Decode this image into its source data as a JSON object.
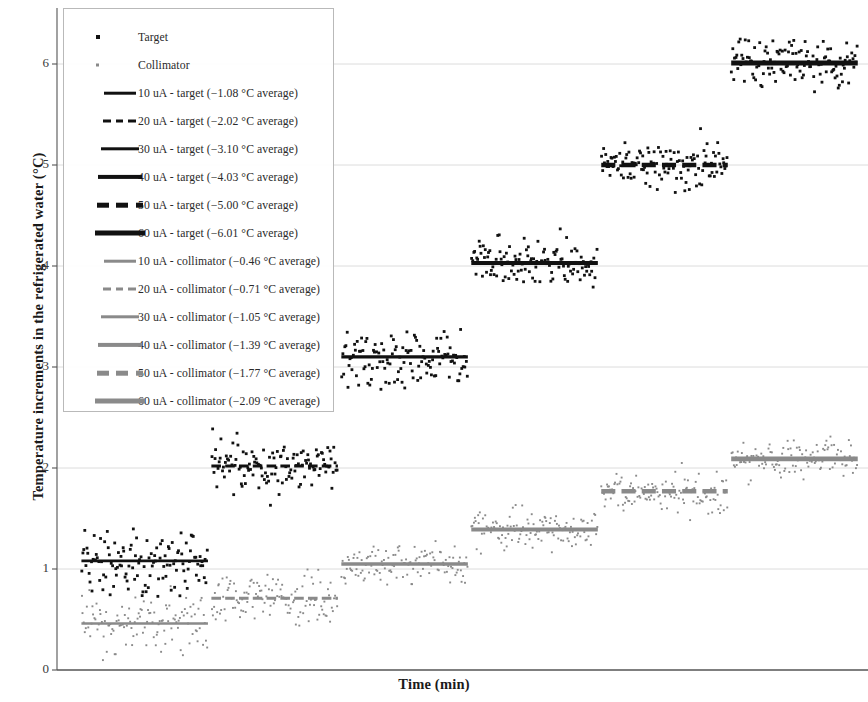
{
  "chart_data": {
    "type": "scatter",
    "title": "",
    "xlabel": "Time (min)",
    "ylabel": "Temperature increments in the refrigerated water (°C)",
    "ylim": [
      0,
      6.4
    ],
    "yticks": [
      0,
      1,
      2,
      3,
      4,
      5,
      6
    ],
    "ytick_labels": [
      "0",
      "1",
      "2",
      "3",
      "4",
      "5",
      "6"
    ],
    "xticks": [],
    "xtick_labels": [],
    "grid": "horizontal",
    "legend_position": "upper-left-inside",
    "colors": {
      "target": "#111111",
      "collimator": "#8a8a8a",
      "gridline": "#dcdcdc",
      "axis": "#555555"
    },
    "series": [
      {
        "name": "Target",
        "marker": "square",
        "color": "#111111",
        "steps": [
          {
            "current": "10 uA",
            "average": 1.08,
            "x_start": 0.5,
            "x_end": 19.0,
            "scatter_sd": 0.3,
            "n": 120
          },
          {
            "current": "20 uA",
            "average": 2.02,
            "x_start": 19.5,
            "x_end": 38.0,
            "scatter_sd": 0.23,
            "n": 120
          },
          {
            "current": "30 uA",
            "average": 3.1,
            "x_start": 38.5,
            "x_end": 57.0,
            "scatter_sd": 0.22,
            "n": 120
          },
          {
            "current": "40 uA",
            "average": 4.03,
            "x_start": 57.5,
            "x_end": 76.0,
            "scatter_sd": 0.2,
            "n": 120
          },
          {
            "current": "50 uA",
            "average": 5.0,
            "x_start": 76.5,
            "x_end": 95.0,
            "scatter_sd": 0.22,
            "n": 120
          },
          {
            "current": "60 uA",
            "average": 6.01,
            "x_start": 95.5,
            "x_end": 114.0,
            "scatter_sd": 0.22,
            "n": 120
          }
        ]
      },
      {
        "name": "Collimator",
        "marker": "dot",
        "color": "#8a8a8a",
        "steps": [
          {
            "current": "10 uA",
            "average": 0.46,
            "x_start": 0.5,
            "x_end": 19.0,
            "scatter_sd": 0.22,
            "n": 120
          },
          {
            "current": "20 uA",
            "average": 0.71,
            "x_start": 19.5,
            "x_end": 38.0,
            "scatter_sd": 0.2,
            "n": 120
          },
          {
            "current": "30 uA",
            "average": 1.05,
            "x_start": 38.5,
            "x_end": 57.0,
            "scatter_sd": 0.19,
            "n": 120
          },
          {
            "current": "40 uA",
            "average": 1.39,
            "x_start": 57.5,
            "x_end": 76.0,
            "scatter_sd": 0.18,
            "n": 120
          },
          {
            "current": "50 uA",
            "average": 1.77,
            "x_start": 76.5,
            "x_end": 95.0,
            "scatter_sd": 0.17,
            "n": 120
          },
          {
            "current": "60 uA",
            "average": 2.09,
            "x_start": 95.5,
            "x_end": 114.0,
            "scatter_sd": 0.17,
            "n": 120
          }
        ]
      }
    ],
    "average_lines": [
      {
        "label": "10 uA - target",
        "value": 1.08,
        "group": "target",
        "style": "solid",
        "width": 2.6
      },
      {
        "label": "20 uA - target",
        "value": 2.02,
        "group": "target",
        "style": "dashed",
        "width": 3.0
      },
      {
        "label": "30 uA - target",
        "value": 3.1,
        "group": "target",
        "style": "solid",
        "width": 3.4
      },
      {
        "label": "40 uA - target",
        "value": 4.03,
        "group": "target",
        "style": "solid",
        "width": 4.0
      },
      {
        "label": "50 uA - target",
        "value": 5.0,
        "group": "target",
        "style": "dashed",
        "width": 4.4
      },
      {
        "label": "60 uA - target",
        "value": 6.01,
        "group": "target",
        "style": "solid",
        "width": 4.8
      },
      {
        "label": "10 uA - collimator",
        "value": 0.46,
        "group": "collimator",
        "style": "solid",
        "width": 2.6
      },
      {
        "label": "20 uA - collimator",
        "value": 0.71,
        "group": "collimator",
        "style": "dashed",
        "width": 3.0
      },
      {
        "label": "30 uA - collimator",
        "value": 1.05,
        "group": "collimator",
        "style": "solid",
        "width": 3.4
      },
      {
        "label": "40 uA - collimator",
        "value": 1.39,
        "group": "collimator",
        "style": "solid",
        "width": 4.0
      },
      {
        "label": "50 uA - collimator",
        "value": 1.77,
        "group": "collimator",
        "style": "dashed",
        "width": 4.4
      },
      {
        "label": "60 uA - collimator",
        "value": 2.09,
        "group": "collimator",
        "style": "solid",
        "width": 4.8
      }
    ]
  },
  "legend": {
    "entries": [
      {
        "label": "Target",
        "key": "marker-square",
        "group": "target",
        "style": "marker",
        "width": 0
      },
      {
        "label": "Collimator",
        "key": "marker-dot",
        "group": "collimator",
        "style": "marker",
        "width": 0
      },
      {
        "label": "10 uA - target (−1.08 °C average)",
        "key": "line",
        "group": "target",
        "style": "solid",
        "width": 2.6
      },
      {
        "label": "20 uA - target (−2.02 °C average)",
        "key": "line",
        "group": "target",
        "style": "dashed",
        "width": 3.0
      },
      {
        "label": "30 uA - target (−3.10 °C average)",
        "key": "line",
        "group": "target",
        "style": "solid",
        "width": 3.4
      },
      {
        "label": "40 uA - target (−4.03 °C average)",
        "key": "line",
        "group": "target",
        "style": "solid",
        "width": 4.2
      },
      {
        "label": "50 uA - target (−5.00 °C average)",
        "key": "line",
        "group": "target",
        "style": "dashed",
        "width": 4.6
      },
      {
        "label": "60 uA - target (−6.01 °C average)",
        "key": "line",
        "group": "target",
        "style": "solid",
        "width": 5.0
      },
      {
        "label": "10 uA - collimator (−0.46 °C average)",
        "key": "line",
        "group": "collimator",
        "style": "solid",
        "width": 2.6
      },
      {
        "label": "20 uA - collimator (−0.71 °C average)",
        "key": "line",
        "group": "collimator",
        "style": "dashed",
        "width": 3.0
      },
      {
        "label": "30 uA - collimator (−1.05 °C average)",
        "key": "line",
        "group": "collimator",
        "style": "solid",
        "width": 3.4
      },
      {
        "label": "40 uA - collimator (−1.39 °C average)",
        "key": "line",
        "group": "collimator",
        "style": "solid",
        "width": 4.2
      },
      {
        "label": "50 uA - collimator (−1.77 °C average)",
        "key": "line",
        "group": "collimator",
        "style": "dashed",
        "width": 4.6
      },
      {
        "label": "60 uA - collimator (−2.09 °C average)",
        "key": "line",
        "group": "collimator",
        "style": "solid",
        "width": 5.0
      }
    ]
  }
}
